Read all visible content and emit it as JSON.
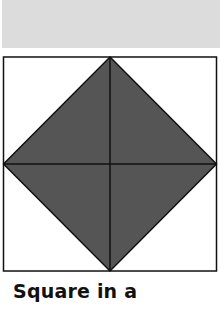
{
  "header": {
    "band_color": "#dcdcdc"
  },
  "figure": {
    "outer_shape": "square",
    "inner_shape": "diamond",
    "fill_color": "#555555",
    "line_color": "#111111",
    "background": "#ffffff"
  },
  "caption": {
    "text": "Square in a"
  }
}
